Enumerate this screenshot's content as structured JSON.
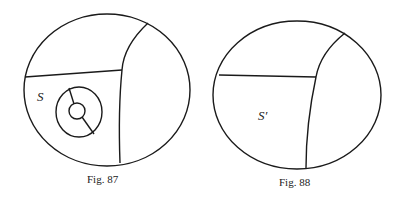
{
  "figures": [
    {
      "id": "fig87",
      "caption": "Fig. 87",
      "region_label": "S"
    },
    {
      "id": "fig88",
      "caption": "Fig. 88",
      "region_label": "S′"
    }
  ],
  "colors": {
    "ink": "#1a1a1a",
    "background": "#ffffff"
  }
}
